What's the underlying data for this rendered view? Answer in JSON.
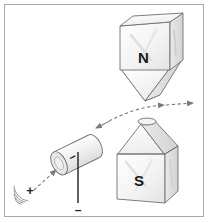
{
  "figure": {
    "border_color": "#a9a9a9",
    "background": "#ffffff",
    "ink_color": "#555555",
    "label_color": "#1a1a1a"
  },
  "magnets": {
    "north": {
      "label": "N",
      "shape": "block-with-downward-pyramid-tip",
      "position": "top-right"
    },
    "south": {
      "label": "S",
      "shape": "block-with-upward-pyramid-tip",
      "position": "bottom-right"
    }
  },
  "tube": {
    "name": "cathode-cylinder",
    "body_sign": "–",
    "orientation": "tilted-diagonal",
    "open_end": "lower-left"
  },
  "terminals": {
    "positive": {
      "sign": "+",
      "name": "positive-terminal",
      "position": "bottom-left"
    },
    "negative": {
      "sign": "–",
      "name": "negative-terminal",
      "position": "below-cylinder"
    }
  },
  "beam": {
    "name": "ray-path",
    "style": "dashed",
    "arrowheads": 4,
    "description": "dashed ray entering cylinder and curving up to the right between the poles"
  }
}
